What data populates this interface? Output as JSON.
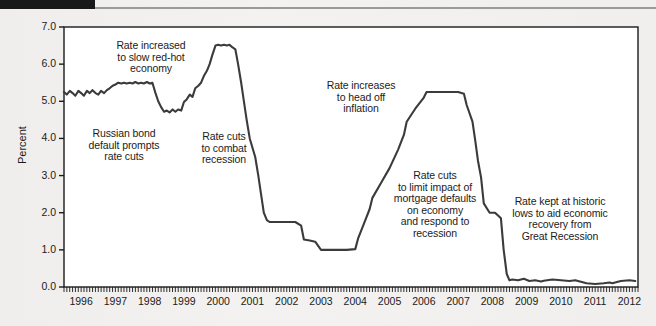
{
  "figure": {
    "background_color": "#f1f0ee",
    "plot_background_color": "#ffffff",
    "line_color": "#3b3b3b",
    "frame_color": "#1b1b1b",
    "black_bar_color": "#18181a"
  },
  "chart_data": {
    "type": "line",
    "title": "",
    "xlabel": "",
    "ylabel": "Percent",
    "xlim": [
      1996,
      2012.75
    ],
    "ylim": [
      0.0,
      7.0
    ],
    "yticks": [
      "0.0",
      "1.0",
      "2.0",
      "3.0",
      "4.0",
      "5.0",
      "6.0",
      "7.0"
    ],
    "ytick_values": [
      0.0,
      1.0,
      2.0,
      3.0,
      4.0,
      5.0,
      6.0,
      7.0
    ],
    "xticks": [
      "1996",
      "1997",
      "1998",
      "1999",
      "2000",
      "2001",
      "2002",
      "2003",
      "2004",
      "2005",
      "2006",
      "2007",
      "2008",
      "2009",
      "2010",
      "2011",
      "2012"
    ],
    "xtick_values": [
      1996,
      1997,
      1998,
      1999,
      2000,
      2001,
      2002,
      2003,
      2004,
      2005,
      2006,
      2007,
      2008,
      2009,
      2010,
      2011,
      2012
    ],
    "minor_ticks": "monthly",
    "grid": false,
    "legend": "none",
    "series": [
      {
        "name": "Federal funds rate",
        "x": [
          1996.0,
          1996.08,
          1996.17,
          1996.25,
          1996.33,
          1996.42,
          1996.5,
          1996.58,
          1996.67,
          1996.75,
          1996.83,
          1996.92,
          1997.0,
          1997.08,
          1997.17,
          1997.25,
          1997.33,
          1997.42,
          1997.5,
          1997.58,
          1997.67,
          1997.75,
          1997.83,
          1997.92,
          1998.0,
          1998.08,
          1998.17,
          1998.25,
          1998.33,
          1998.42,
          1998.5,
          1998.58,
          1998.67,
          1998.75,
          1998.83,
          1998.92,
          1999.0,
          1999.08,
          1999.17,
          1999.25,
          1999.33,
          1999.42,
          1999.5,
          1999.58,
          1999.67,
          1999.75,
          1999.83,
          1999.92,
          2000.0,
          2000.08,
          2000.17,
          2000.25,
          2000.33,
          2000.42,
          2000.5,
          2000.58,
          2000.67,
          2000.75,
          2000.83,
          2000.92,
          2001.0,
          2001.08,
          2001.17,
          2001.25,
          2001.33,
          2001.42,
          2001.5,
          2001.58,
          2001.67,
          2001.75,
          2001.83,
          2001.92,
          2002.0,
          2002.25,
          2002.5,
          2002.75,
          2002.92,
          2003.0,
          2003.17,
          2003.33,
          2003.5,
          2003.58,
          2003.75,
          2003.92,
          2004.0,
          2004.25,
          2004.5,
          2004.58,
          2004.75,
          2004.92,
          2005.0,
          2005.25,
          2005.5,
          2005.75,
          2005.92,
          2006.0,
          2006.25,
          2006.5,
          2006.58,
          2006.75,
          2006.92,
          2007.0,
          2007.25,
          2007.5,
          2007.67,
          2007.75,
          2007.92,
          2008.0,
          2008.08,
          2008.17,
          2008.25,
          2008.42,
          2008.58,
          2008.75,
          2008.83,
          2008.92,
          2009.0,
          2009.08,
          2009.25,
          2009.42,
          2009.58,
          2009.75,
          2009.92,
          2010.0,
          2010.25,
          2010.5,
          2010.75,
          2010.92,
          2011.0,
          2011.25,
          2011.5,
          2011.75,
          2011.92,
          2012.0,
          2012.25,
          2012.5,
          2012.67
        ],
        "y": [
          5.25,
          5.18,
          5.28,
          5.22,
          5.15,
          5.28,
          5.22,
          5.15,
          5.28,
          5.22,
          5.3,
          5.22,
          5.18,
          5.28,
          5.22,
          5.3,
          5.35,
          5.42,
          5.45,
          5.5,
          5.48,
          5.5,
          5.48,
          5.5,
          5.48,
          5.52,
          5.48,
          5.5,
          5.48,
          5.52,
          5.48,
          5.5,
          5.22,
          5.0,
          4.85,
          4.72,
          4.75,
          4.7,
          4.78,
          4.72,
          4.78,
          4.75,
          4.98,
          5.05,
          5.18,
          5.12,
          5.35,
          5.42,
          5.5,
          5.68,
          5.82,
          6.0,
          6.25,
          6.5,
          6.52,
          6.5,
          6.52,
          6.5,
          6.52,
          6.45,
          6.4,
          6.0,
          5.5,
          5.0,
          4.5,
          4.0,
          3.75,
          3.5,
          3.0,
          2.5,
          2.0,
          1.8,
          1.75,
          1.75,
          1.75,
          1.75,
          1.65,
          1.28,
          1.25,
          1.22,
          1.0,
          1.0,
          1.0,
          1.0,
          1.0,
          1.0,
          1.02,
          1.3,
          1.7,
          2.1,
          2.4,
          2.8,
          3.2,
          3.7,
          4.1,
          4.45,
          4.8,
          5.1,
          5.25,
          5.25,
          5.25,
          5.25,
          5.25,
          5.25,
          5.2,
          4.9,
          4.45,
          3.95,
          3.4,
          2.95,
          2.25,
          2.0,
          2.0,
          1.85,
          1.0,
          0.35,
          0.18,
          0.2,
          0.18,
          0.22,
          0.16,
          0.18,
          0.15,
          0.17,
          0.2,
          0.18,
          0.16,
          0.18,
          0.16,
          0.1,
          0.08,
          0.1,
          0.12,
          0.1,
          0.16,
          0.18,
          0.16
        ]
      }
    ],
    "annotations": [
      {
        "id": "rate-increased",
        "text": "Rate increased\nto slow red-hot\neconomy"
      },
      {
        "id": "russian-bond",
        "text": "Russian bond\ndefault prompts\nrate cuts"
      },
      {
        "id": "rate-cuts-recession",
        "text": "Rate cuts\nto combat\nrecession"
      },
      {
        "id": "rate-increases-inflation",
        "text": "Rate increases\nto head off\ninflation"
      },
      {
        "id": "rate-cuts-mortgage",
        "text": "Rate cuts\nto limit impact of\nmortgage defaults\non economy\nand respond to\nrecession"
      },
      {
        "id": "rate-kept-historic-lows",
        "text": "Rate kept at historic\nlows to aid economic\nrecovery from\nGreat Recession"
      }
    ]
  }
}
